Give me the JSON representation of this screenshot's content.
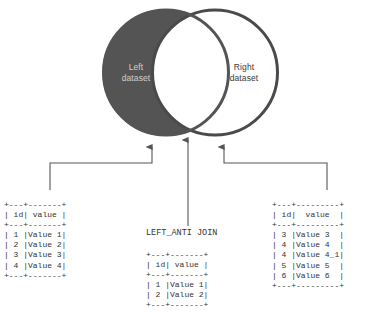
{
  "diagram": {
    "title_caption": "LEFT_ANTI JOIN",
    "colors": {
      "left_circle_fill": "#545454",
      "left_circle_stroke": "#545454",
      "right_circle_fill": "#ffffff",
      "right_circle_stroke": "#4a4a4a",
      "left_label_text": "#cfcfcf",
      "right_label_text": "#3a3a3a",
      "connector": "#555555",
      "table_text": "#333333",
      "background": "#ffffff"
    },
    "venn": {
      "left": {
        "label_line1": "Left",
        "label_line2": "dataset"
      },
      "right": {
        "label_line1": "Right",
        "label_line2": "dataset"
      }
    },
    "connectors": [
      {
        "name": "left-dataset-connector",
        "kind": "elbow-right-up"
      },
      {
        "name": "result-connector",
        "kind": "straight-up"
      },
      {
        "name": "right-dataset-connector",
        "kind": "elbow-left-up"
      }
    ]
  },
  "tables": {
    "left": {
      "name": "left-dataset-table",
      "columns": [
        "id",
        "value"
      ],
      "rows": [
        [
          "1",
          "Value 1"
        ],
        [
          "2",
          "Value 2"
        ],
        [
          "3",
          "Value 3"
        ],
        [
          "4",
          "Value 4"
        ]
      ],
      "ascii": "+---+-------+\n| id| value |\n+---+-------+\n| 1 |Value 1|\n| 2 |Value 2|\n| 3 |Value 3|\n| 4 |Value 4|\n+---+-------+"
    },
    "center": {
      "name": "result-table",
      "columns": [
        "id",
        "value"
      ],
      "rows": [
        [
          "1",
          "Value 1"
        ],
        [
          "2",
          "Value 2"
        ]
      ],
      "ascii": "+---+-------+\n| id| value |\n+---+-------+\n| 1 |Value 1|\n| 2 |Value 2|\n+---+-------+"
    },
    "right": {
      "name": "right-dataset-table",
      "columns": [
        "id",
        "value"
      ],
      "rows": [
        [
          "3",
          "Value 3"
        ],
        [
          "4",
          "Value 4"
        ],
        [
          "4",
          "Value 4_1"
        ],
        [
          "5",
          "Value 5"
        ],
        [
          "6",
          "Value 6"
        ]
      ],
      "ascii": "+---+---------+\n| id|  value  |\n+---+---------+\n| 3 |Value 3  |\n| 4 |Value 4  |\n| 4 |Value 4_1|\n| 5 |Value 5  |\n| 6 |Value 6  |\n+---+---------+"
    }
  }
}
